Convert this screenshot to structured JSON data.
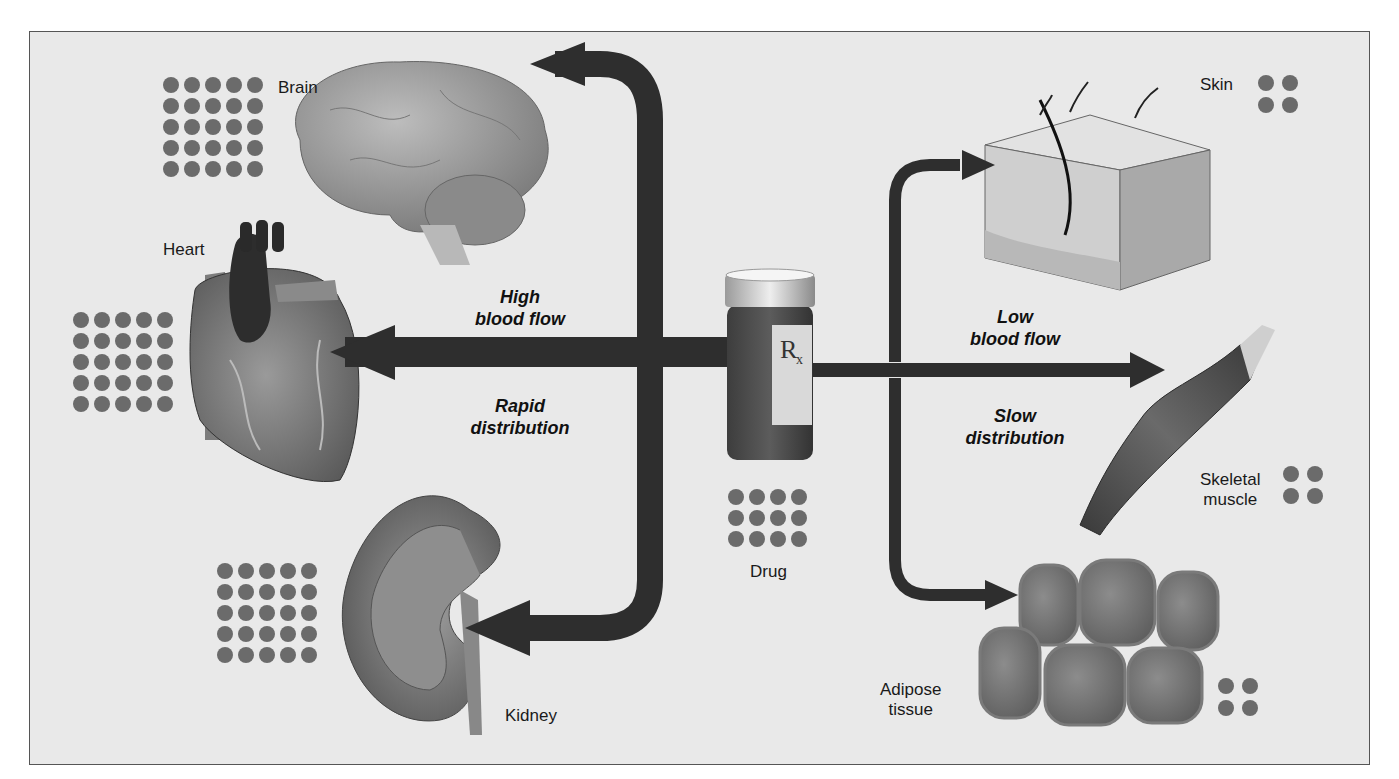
{
  "figure": {
    "center": {
      "label": "Drug",
      "bottle_symbol": "Rx",
      "dot_rows": 3,
      "dot_cols": 4
    },
    "high_flow": {
      "line1": "High",
      "line2": "blood flow",
      "line3": "Rapid",
      "line4": "distribution"
    },
    "low_flow": {
      "line1": "Low",
      "line2": "blood flow",
      "line3": "Slow",
      "line4": "distribution"
    },
    "organs": [
      {
        "name": "Brain",
        "dots": "5x5"
      },
      {
        "name": "Heart",
        "dots": "5x5"
      },
      {
        "name": "Kidney",
        "dots": "5x5"
      },
      {
        "name": "Skin",
        "dots": "2x2"
      },
      {
        "name": "Skeletal muscle",
        "line1": "Skeletal",
        "line2": "muscle",
        "dots": "2x2"
      },
      {
        "name": "Adipose tissue",
        "line1": "Adipose",
        "line2": "tissue",
        "dots": "2x2"
      }
    ],
    "colors": {
      "background": "#e9e9e9",
      "arrow": "#2e2e2e",
      "dot": "#6b6b6b"
    }
  }
}
